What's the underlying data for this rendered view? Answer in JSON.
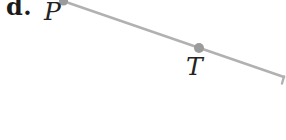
{
  "figure": {
    "part_label": "d.",
    "points": [
      {
        "name": "P",
        "label": "P"
      },
      {
        "name": "T",
        "label": "T"
      }
    ],
    "colors": {
      "line": "#b1b1b1",
      "point_dot": "#9b9b9b",
      "label_text": "#1b1b1b",
      "background": "#ffffff"
    }
  }
}
